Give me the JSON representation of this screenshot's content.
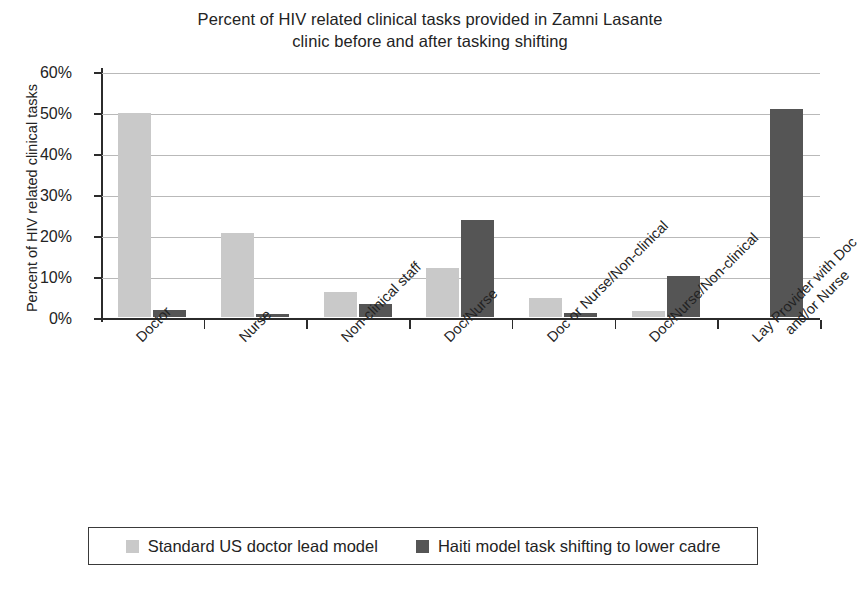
{
  "chart_data": {
    "type": "bar",
    "title": "Percent of HIV related clinical tasks provided in Zamni Lasante clinic before and after tasking shifting",
    "title_line1": "Percent of HIV related clinical tasks provided in Zamni Lasante",
    "title_line2": "clinic before and after tasking shifting",
    "xlabel": "",
    "ylabel": "Percent of HIV related clinical tasks",
    "ylim": [
      0,
      60
    ],
    "ytick_values": [
      0,
      10,
      20,
      30,
      40,
      50,
      60
    ],
    "ytick_labels": [
      "0%",
      "10%",
      "20%",
      "30%",
      "40%",
      "50%",
      "60%"
    ],
    "grid": "horizontal",
    "legend_position": "bottom",
    "categories": [
      "Doctor",
      "Nurse",
      "Non-clinical staff",
      "Doc/Nurse",
      "Doc or Nurse/Non-clinical",
      "Doc/Nurse/Non-clinical",
      "Lay Provider with Doc\nand/or Nurse"
    ],
    "category_labels_display": [
      "Doctor",
      "Nurse",
      "Non-clinical staff",
      "Doc/Nurse",
      "Doc or Nurse/Non-clinical",
      "Doc/Nurse/Non-clinical",
      "Lay Provider with Doc\nand/or Nurse"
    ],
    "series": [
      {
        "name": "Standard US doctor lead model",
        "color": "#c9c9c9",
        "values": [
          49.8,
          20.4,
          6.1,
          12.0,
          4.7,
          1.5,
          0
        ]
      },
      {
        "name": "Haiti model task shifting to lower cadre",
        "color": "#555555",
        "values": [
          1.8,
          0.8,
          3.1,
          23.7,
          0.9,
          10.0,
          50.7
        ]
      }
    ]
  },
  "legend": {
    "items": [
      {
        "label": "Standard US doctor lead model",
        "swatch": "light"
      },
      {
        "label": "Haiti model task shifting to lower cadre",
        "swatch": "dark"
      }
    ]
  }
}
